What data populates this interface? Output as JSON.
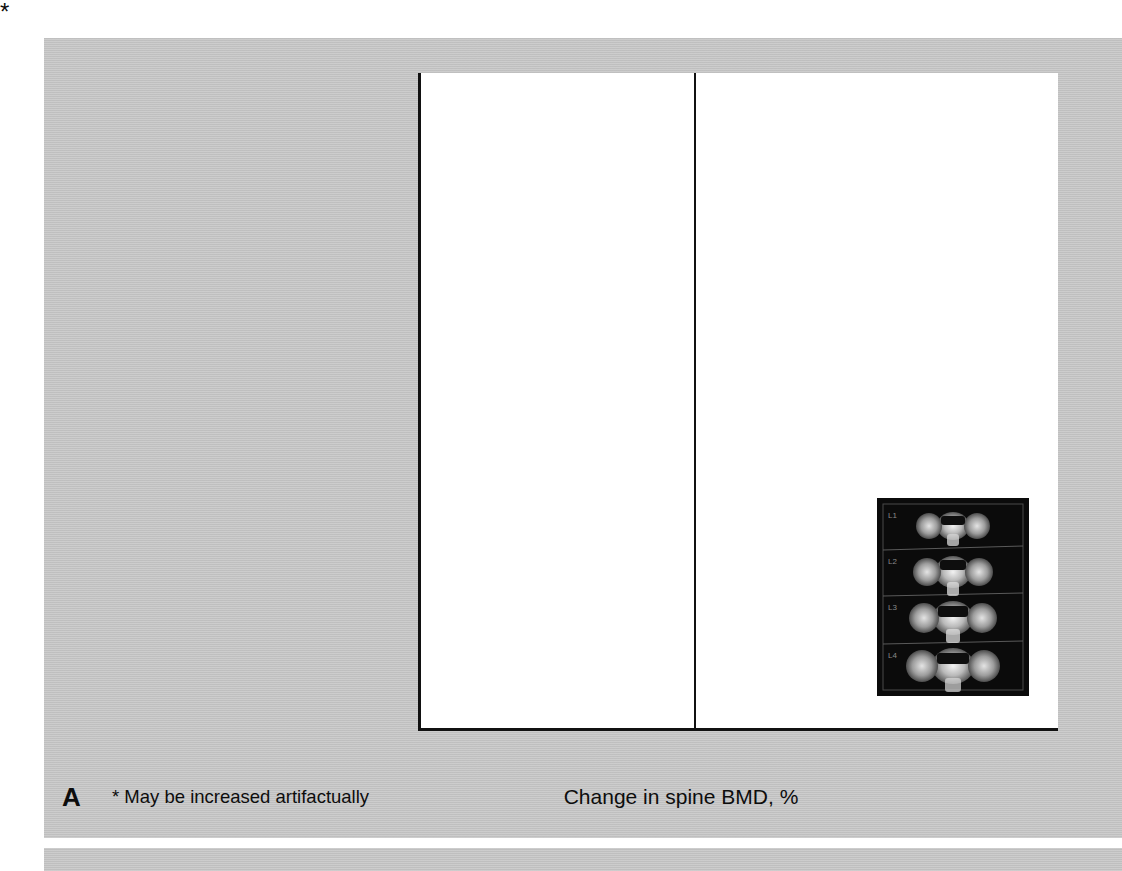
{
  "figure": {
    "panel_letter": "A",
    "footnote": "* May be increased artifactually",
    "bar_annotation": "*"
  },
  "chart_data": {
    "type": "bar",
    "orientation": "horizontal",
    "title": "",
    "xlabel": "Change in spine BMD, %",
    "ylabel": "",
    "xlim": [
      -6,
      8
    ],
    "xticks": [
      -6,
      -4,
      -2,
      0,
      2,
      4,
      6,
      8
    ],
    "xtick_labels": [
      "−6",
      "−4",
      "−2",
      "0",
      "2",
      "4",
      "6",
      "8"
    ],
    "grid": false,
    "legend": "none",
    "bar_color": "#545454",
    "axis_color": "#111111",
    "categories": [
      "African ancestry",
      "Osteoarthritis",
      "Diabetes",
      "COX II inhibitor",
      "Hypertension",
      "Weight per 10 kg",
      "Age per 5 y",
      "Alcohol per drink/d",
      "Grip strength per 1 SD",
      "Height per 6.8 cm",
      "Nontrauma fracture after age 50",
      "Prostate cancer",
      "Maternal history fracture",
      "Kidney stones",
      "Glucocorticoid use",
      "COPD",
      "Paternal history fracture",
      "SSRI use"
    ],
    "values": [
      6.4,
      4.5,
      4.0,
      2.9,
      2.4,
      2.2,
      1.9,
      1.0,
      0.9,
      0.9,
      0.5,
      -1.5,
      -1.7,
      -1.8,
      -2.5,
      -2.6,
      -4.5,
      -5.1
    ],
    "annotations": [
      {
        "category": "Osteoarthritis",
        "marker": "*",
        "note": "May be increased artifactually"
      }
    ]
  },
  "inset": {
    "name": "dxa-spine-scan",
    "vertebra_labels": [
      "L1",
      "L2",
      "L3",
      "L4"
    ]
  }
}
